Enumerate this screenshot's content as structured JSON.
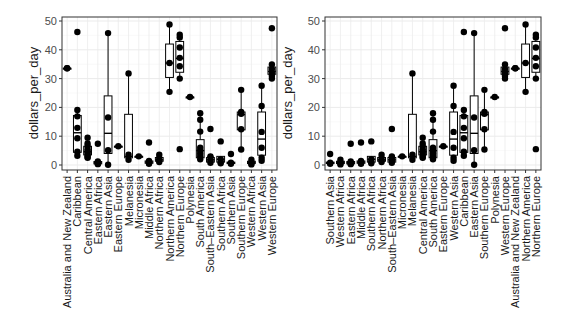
{
  "chart_data": [
    {
      "type": "boxplot",
      "title": "",
      "xlabel": "",
      "ylabel": "dollars_per_day",
      "ylim": [
        0,
        50
      ],
      "yticks": [
        0,
        10,
        20,
        30,
        40,
        50
      ],
      "grid": true,
      "legend": "none",
      "ordering": "alphabetical",
      "categories": [
        "Australia and New Zealand",
        "Caribbean",
        "Central America",
        "Eastern Africa",
        "Eastern Asia",
        "Eastern Europe",
        "Melanesia",
        "Micronesia",
        "Middle Africa",
        "Northern Africa",
        "Northern America",
        "Northern Europe",
        "Polynesia",
        "South America",
        "South-Eastern Asia",
        "Southern Africa",
        "Southern Asia",
        "Southern Europe",
        "Western Africa",
        "Western Asia",
        "Western Europe"
      ],
      "boxes": [
        {
          "q1": 33.6,
          "median": 33.6,
          "q3": 33.6,
          "min": 33.6,
          "max": 33.6,
          "points": [
            33.6,
            33.6
          ]
        },
        {
          "q1": 4.4,
          "median": 11.2,
          "q3": 17.2,
          "min": 3.2,
          "max": 19.1,
          "points": [
            46.2,
            19.1,
            16.9,
            12.9,
            9.3,
            4.6,
            3.2
          ]
        },
        {
          "q1": 3.5,
          "median": 4.6,
          "q3": 6.5,
          "min": 2.5,
          "max": 9.5,
          "points": [
            9.5,
            7.5,
            6.5,
            5.5,
            4.8,
            4.2,
            3.5,
            2.8,
            2.5
          ]
        },
        {
          "q1": 0.4,
          "median": 0.8,
          "q3": 1.2,
          "min": 0.2,
          "max": 1.6,
          "points": [
            7.4,
            1.2,
            0.8,
            0.5,
            0.3
          ]
        },
        {
          "q1": 4.0,
          "median": 11.0,
          "q3": 24.0,
          "min": 0.1,
          "max": 45.8,
          "points": [
            45.8,
            16.5,
            5.1,
            0.1
          ]
        },
        {
          "q1": 6.5,
          "median": 6.5,
          "q3": 6.5,
          "min": 6.5,
          "max": 6.5,
          "points": [
            6.5
          ]
        },
        {
          "q1": 2.5,
          "median": 3.0,
          "q3": 17.6,
          "min": 1.8,
          "max": 31.8,
          "points": [
            31.8,
            3.6,
            1.8
          ]
        },
        {
          "q1": 3.0,
          "median": 3.0,
          "q3": 3.0,
          "min": 3.0,
          "max": 3.0,
          "points": [
            3.0
          ]
        },
        {
          "q1": 0.6,
          "median": 1.0,
          "q3": 1.4,
          "min": 0.3,
          "max": 1.8,
          "points": [
            7.8,
            1.4,
            0.8,
            0.4
          ]
        },
        {
          "q1": 1.3,
          "median": 1.8,
          "q3": 2.6,
          "min": 1.0,
          "max": 3.6,
          "points": [
            3.6,
            2.4,
            1.6,
            1.0
          ]
        },
        {
          "q1": 30.4,
          "median": 35.4,
          "q3": 42.0,
          "min": 25.4,
          "max": 48.8,
          "points": [
            48.8,
            35.4,
            25.4
          ]
        },
        {
          "q1": 32.2,
          "median": 37.0,
          "q3": 42.9,
          "min": 30.0,
          "max": 45.2,
          "points": [
            45.2,
            44.3,
            40.8,
            37.2,
            34.3,
            30.0,
            5.5
          ]
        },
        {
          "q1": 23.6,
          "median": 23.6,
          "q3": 23.6,
          "min": 23.6,
          "max": 23.6,
          "points": [
            23.6
          ]
        },
        {
          "q1": 2.5,
          "median": 5.0,
          "q3": 8.8,
          "min": 1.8,
          "max": 18.0,
          "points": [
            18.0,
            15.7,
            11.6,
            6.0,
            5.0,
            4.0,
            3.0,
            2.0
          ]
        },
        {
          "q1": 1.0,
          "median": 1.8,
          "q3": 2.6,
          "min": 0.5,
          "max": 3.0,
          "points": [
            12.5,
            3.0,
            2.5,
            1.5,
            0.8
          ]
        },
        {
          "q1": 1.0,
          "median": 2.0,
          "q3": 3.0,
          "min": 0.6,
          "max": 3.0,
          "points": [
            8.2,
            2.0,
            1.0,
            0.6
          ]
        },
        {
          "q1": 0.5,
          "median": 0.8,
          "q3": 1.0,
          "min": 0.3,
          "max": 1.2,
          "points": [
            3.8,
            0.8,
            0.4
          ]
        },
        {
          "q1": 12.2,
          "median": 17.5,
          "q3": 18.4,
          "min": 5.4,
          "max": 26.1,
          "points": [
            26.1,
            18.4,
            17.8,
            12.4,
            5.4
          ]
        },
        {
          "q1": 0.5,
          "median": 0.9,
          "q3": 1.3,
          "min": 0.2,
          "max": 1.8,
          "points": [
            1.8,
            1.0,
            0.5,
            0.2
          ]
        },
        {
          "q1": 3.4,
          "median": 9.0,
          "q3": 18.4,
          "min": 1.2,
          "max": 27.5,
          "points": [
            27.5,
            20.5,
            11.5,
            6.0,
            2.5,
            1.5
          ]
        },
        {
          "q1": 31.5,
          "median": 32.5,
          "q3": 34.0,
          "min": 30.0,
          "max": 34.9,
          "points": [
            47.5,
            34.9,
            33.3,
            32.0,
            31.0,
            30.0
          ]
        }
      ]
    },
    {
      "type": "boxplot",
      "title": "",
      "xlabel": "",
      "ylabel": "dollars_per_day",
      "ylim": [
        0,
        50
      ],
      "yticks": [
        0,
        10,
        20,
        30,
        40,
        50
      ],
      "grid": true,
      "legend": "none",
      "ordering": "by median",
      "categories": [
        "Southern Asia",
        "Western Africa",
        "Eastern Africa",
        "Middle Africa",
        "Southern Africa",
        "Northern Africa",
        "South-Eastern Asia",
        "Micronesia",
        "Melanesia",
        "Central America",
        "South America",
        "Eastern Europe",
        "Western Asia",
        "Caribbean",
        "Eastern Asia",
        "Southern Europe",
        "Polynesia",
        "Western Europe",
        "Australia and New Zealand",
        "Northern America",
        "Northern Europe"
      ]
    }
  ],
  "panels": {
    "left": {
      "ylabel": "dollars_per_day",
      "yticks": [
        "0",
        "10",
        "20",
        "30",
        "40",
        "50"
      ],
      "xlabels": [
        "Australia and New Zealand",
        "Caribbean",
        "Central America",
        "Eastern Africa",
        "Eastern Asia",
        "Eastern Europe",
        "Melanesia",
        "Micronesia",
        "Middle Africa",
        "Northern Africa",
        "Northern America",
        "Northern Europe",
        "Polynesia",
        "South America",
        "South–Eastern Asia",
        "Southern Africa",
        "Southern Asia",
        "Southern Europe",
        "Western Africa",
        "Western Asia",
        "Western Europe"
      ]
    },
    "right": {
      "ylabel": "dollars_per_day",
      "yticks": [
        "0",
        "10",
        "20",
        "30",
        "40",
        "50"
      ],
      "xlabels": [
        "Southern Asia",
        "Western Africa",
        "Eastern Africa",
        "Middle Africa",
        "Southern Africa",
        "Northern Africa",
        "South–Eastern Asia",
        "Micronesia",
        "Melanesia",
        "Central America",
        "South America",
        "Eastern Europe",
        "Western Asia",
        "Caribbean",
        "Eastern Asia",
        "Southern Europe",
        "Polynesia",
        "Western Europe",
        "Australia and New Zealand",
        "Northern America",
        "Northern Europe"
      ]
    }
  },
  "colors": {
    "panel_bg": "#ffffff",
    "grid_major": "#ebebeb",
    "grid_minor": "#f5f5f5",
    "frame": "#333333",
    "ink": "#000000",
    "tick_text": "#4d4d4d"
  }
}
